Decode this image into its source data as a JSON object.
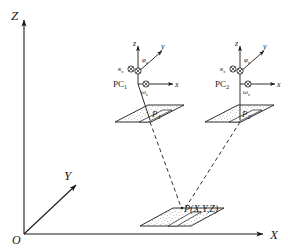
{
  "figure": {
    "stroke_color": "#1a1a1a",
    "fill_color": "#ffffff",
    "background": "#ffffff"
  },
  "world_frame": {
    "origin_label": "O",
    "axes": [
      {
        "name": "z-axis",
        "label": "Z"
      },
      {
        "name": "y-axis",
        "label": "Y"
      },
      {
        "name": "x-axis",
        "label": "X"
      }
    ]
  },
  "cameras": [
    {
      "name": "PC",
      "subscript": "1",
      "axes": {
        "x": "x",
        "y": "y",
        "z": "z"
      },
      "angles": {
        "omega": "ω",
        "omega_sub": "c",
        "phi": "φ",
        "phi_sub": "c",
        "kappa": "κ",
        "kappa_sub": "c"
      },
      "image_point": {
        "label": "P",
        "subscript": "1"
      }
    },
    {
      "name": "PC",
      "subscript": "2",
      "axes": {
        "x": "x",
        "y": "y",
        "z": "z"
      },
      "angles": {
        "omega": "ω",
        "omega_sub": "c",
        "phi": "φ",
        "phi_sub": "c",
        "kappa": "κ",
        "kappa_sub": "c"
      },
      "image_point": {
        "label": "P",
        "subscript": "2"
      }
    }
  ],
  "ground_point": {
    "label": "P(X,Y,Z)"
  }
}
